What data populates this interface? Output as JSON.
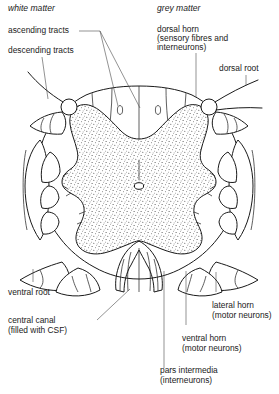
{
  "figure": {
    "background": "#ffffff",
    "ink": "#1a1a1a",
    "leader_color": "#4a4a4a"
  },
  "headings": {
    "white_matter": "white matter",
    "grey_matter": "grey matter"
  },
  "labels": {
    "ascending_tracts": "ascending tracts",
    "descending_tracts": "descending tracts",
    "dorsal_horn_l1": "dorsal horn",
    "dorsal_horn_l2": "(sensory fibres and",
    "dorsal_horn_l3": "interneurons)",
    "dorsal_root": "dorsal root",
    "ventral_root": "ventral root",
    "central_canal_l1": "central canal",
    "central_canal_l2": "(filled with CSF)",
    "lateral_horn_l1": "lateral horn",
    "lateral_horn_l2": "(motor neurons)",
    "ventral_horn_l1": "ventral horn",
    "ventral_horn_l2": "(motor neurons)",
    "pars_intermedia_l1": "pars intermedia",
    "pars_intermedia_l2": "(interneurons)"
  },
  "structures": {
    "grey_matter_fill": "stippled",
    "white_matter_fill": "white",
    "central_canal_shape": "small oval"
  }
}
